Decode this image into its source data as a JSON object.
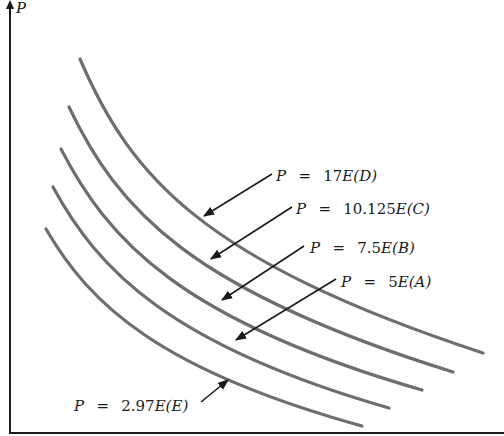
{
  "diagram": {
    "type": "isoquant-curves",
    "axis": {
      "y_label": "P",
      "x_label": ""
    },
    "colors": {
      "curve": "#6e6e6e",
      "axis": "#1a1a1a",
      "arrow": "#1a1a1a",
      "background": "#ffffff"
    },
    "curves": [
      {
        "id": "D",
        "equation": "P = 17E(D)",
        "lhs": "P",
        "eq": "=",
        "coef": "17",
        "var": "E",
        "tag": "(D)",
        "start": [
          80,
          59
        ],
        "end": [
          483,
          353
        ]
      },
      {
        "id": "C",
        "equation": "P = 10.125E(C)",
        "lhs": "P",
        "eq": "=",
        "coef": "10.125",
        "var": "E",
        "tag": "(C)",
        "start": [
          69,
          107
        ],
        "end": [
          453,
          372
        ]
      },
      {
        "id": "B",
        "equation": "P = 7.5E(B)",
        "lhs": "P",
        "eq": "=",
        "coef": "7.5",
        "var": "E",
        "tag": "(B)",
        "start": [
          61,
          149
        ],
        "end": [
          422,
          390
        ]
      },
      {
        "id": "A",
        "equation": "P = 5E(A)",
        "lhs": "P",
        "eq": "=",
        "coef": "5",
        "var": "E",
        "tag": "(A)",
        "start": [
          53,
          187
        ],
        "end": [
          389,
          408
        ]
      },
      {
        "id": "E",
        "equation": "P = 2.97E(E)",
        "lhs": "P",
        "eq": "=",
        "coef": "2.97",
        "var": "E",
        "tag": "(E)",
        "start": [
          46,
          229
        ],
        "end": [
          362,
          426
        ]
      }
    ],
    "labels": [
      {
        "curve": "D",
        "text": "P = 17E(D)"
      },
      {
        "curve": "C",
        "text": "P = 10.125E(C)"
      },
      {
        "curve": "B",
        "text": "P = 7.5E(B)"
      },
      {
        "curve": "A",
        "text": "P = 5E(A)"
      },
      {
        "curve": "E",
        "text": "P = 2.97E(E)"
      }
    ]
  }
}
